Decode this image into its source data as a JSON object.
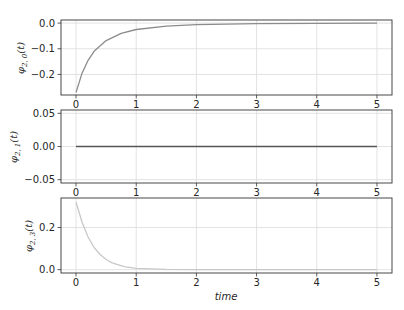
{
  "chart_data": [
    {
      "type": "line",
      "title": "",
      "ylabel": "φ2,0(t)",
      "xlabel": "",
      "xlim": [
        -0.25,
        5.25
      ],
      "ylim": [
        -0.28,
        0.012
      ],
      "xticks": [
        "0",
        "1",
        "2",
        "3",
        "4",
        "5"
      ],
      "yticks": [
        "0.0",
        "-0.1",
        "-0.2"
      ],
      "ytick_values": [
        0.0,
        -0.1,
        -0.2
      ],
      "grid": true,
      "series": [
        {
          "name": "phi_2_0",
          "color": "#8c8c8c",
          "x": [
            0,
            0.1,
            0.2,
            0.3,
            0.5,
            0.75,
            1.0,
            1.5,
            2.0,
            3.0,
            4.0,
            5.0
          ],
          "y": [
            -0.27,
            -0.195,
            -0.145,
            -0.11,
            -0.068,
            -0.04,
            -0.025,
            -0.012,
            -0.006,
            -0.002,
            -0.001,
            0.0
          ]
        }
      ]
    },
    {
      "type": "line",
      "title": "",
      "ylabel": "φ2,1(t)",
      "xlabel": "",
      "xlim": [
        -0.25,
        5.25
      ],
      "ylim": [
        -0.055,
        0.055
      ],
      "xticks": [
        "0",
        "1",
        "2",
        "3",
        "4",
        "5"
      ],
      "yticks": [
        "0.05",
        "0.00",
        "-0.05"
      ],
      "ytick_values": [
        0.05,
        0.0,
        -0.05
      ],
      "grid": true,
      "series": [
        {
          "name": "phi_2_1",
          "color": "#555555",
          "x": [
            0,
            5
          ],
          "y": [
            0.0,
            0.0
          ]
        }
      ]
    },
    {
      "type": "line",
      "title": "",
      "ylabel": "φ2,3(t)",
      "xlabel": "time",
      "xlim": [
        -0.25,
        5.25
      ],
      "ylim": [
        -0.016,
        0.34
      ],
      "xticks": [
        "0",
        "1",
        "2",
        "3",
        "4",
        "5"
      ],
      "yticks": [
        "0.2",
        "0.0"
      ],
      "ytick_values": [
        0.2,
        0.0
      ],
      "grid": true,
      "series": [
        {
          "name": "phi_2_3",
          "color": "#c8c8c8",
          "x": [
            0,
            0.1,
            0.2,
            0.3,
            0.4,
            0.5,
            0.6,
            0.8,
            1.0,
            1.5,
            2.0,
            3.0,
            4.0,
            5.0
          ],
          "y": [
            0.32,
            0.225,
            0.155,
            0.105,
            0.072,
            0.048,
            0.032,
            0.014,
            0.006,
            0.001,
            0.0,
            0.0,
            0.0,
            0.0
          ]
        }
      ]
    }
  ],
  "labels": {
    "ax0_ylabel_main": "φ",
    "ax0_ylabel_sub": "2, 0",
    "ax0_ylabel_arg": "(t)",
    "ax1_ylabel_main": "φ",
    "ax1_ylabel_sub": "2, 1",
    "ax1_ylabel_arg": "(t)",
    "ax2_ylabel_main": "φ",
    "ax2_ylabel_sub": "2, 3",
    "ax2_ylabel_arg": "(t)",
    "xlabel": "time"
  }
}
